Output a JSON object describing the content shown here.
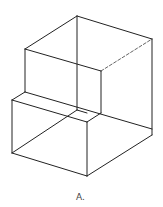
{
  "figure": {
    "label": "A.",
    "stroke_color": "#222222"
  }
}
